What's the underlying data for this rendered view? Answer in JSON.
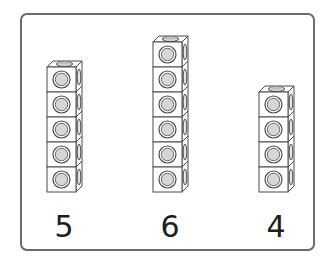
{
  "figure": {
    "type": "unifix-cube-stacks",
    "colors": {
      "frame": "#6b6b6b",
      "outline": "#4a4a4a",
      "cube_fill": "#ffffff",
      "stud_fill": "#d6d6d6",
      "number": "#1e1e1e"
    },
    "stacks": [
      {
        "label": "5",
        "count": 5
      },
      {
        "label": "6",
        "count": 6
      },
      {
        "label": "4",
        "count": 4
      }
    ]
  }
}
